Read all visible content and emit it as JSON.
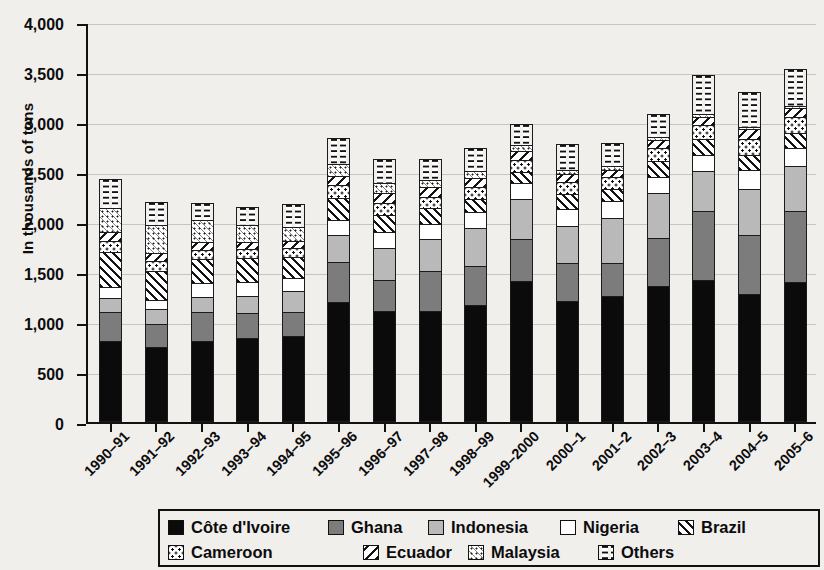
{
  "chart_data": {
    "type": "bar",
    "stacked": true,
    "title": "",
    "subtitle": "",
    "xlabel": "",
    "ylabel": "In thousands of tons",
    "ylim": [
      0,
      4000
    ],
    "ytick_labels": [
      "0",
      "500",
      "1,000",
      "1,500",
      "2,000",
      "2,500",
      "3,000",
      "3,500",
      "4,000"
    ],
    "ytick_values": [
      0,
      500,
      1000,
      1500,
      2000,
      2500,
      3000,
      3500,
      4000
    ],
    "grid": true,
    "legend_position": "bottom",
    "categories": [
      "1990–91",
      "1991–92",
      "1992–93",
      "1993–94",
      "1994–95",
      "1995–96",
      "1996–97",
      "1997–98",
      "1998–99",
      "1999–2000",
      "2000–1",
      "2001–2",
      "2002–3",
      "2003–4",
      "2004–5",
      "2005–6"
    ],
    "series": [
      {
        "name": "Côte d'Ivoire",
        "key": "cote",
        "values": [
          815,
          750,
          815,
          845,
          865,
          1205,
          1110,
          1110,
          1175,
          1410,
          1215,
          1265,
          1360,
          1420,
          1285,
          1405
        ]
      },
      {
        "name": "Ghana",
        "key": "ghana",
        "values": [
          295,
          245,
          295,
          255,
          245,
          405,
          325,
          410,
          395,
          435,
          385,
          340,
          495,
          700,
          595,
          715
        ]
      },
      {
        "name": "Indonesia",
        "key": "indonesia",
        "values": [
          150,
          155,
          165,
          180,
          225,
          285,
          325,
          330,
          390,
          410,
          385,
          455,
          455,
          410,
          475,
          460
        ]
      },
      {
        "name": "Nigeria",
        "key": "nigeria",
        "values": [
          120,
          100,
          145,
          150,
          140,
          160,
          170,
          160,
          170,
          165,
          175,
          185,
          175,
          175,
          200,
          190
        ]
      },
      {
        "name": "Brazil",
        "key": "brazil",
        "values": [
          365,
          300,
          255,
          250,
          215,
          230,
          185,
          170,
          140,
          125,
          160,
          125,
          165,
          165,
          160,
          160
        ]
      },
      {
        "name": "Cameroon",
        "key": "cameroon",
        "values": [
          115,
          115,
          100,
          100,
          105,
          135,
          125,
          125,
          135,
          130,
          135,
          130,
          140,
          155,
          165,
          170
        ]
      },
      {
        "name": "Ecuador",
        "key": "ecuador",
        "values": [
          100,
          90,
          90,
          80,
          75,
          105,
          110,
          105,
          100,
          95,
          90,
          85,
          90,
          90,
          110,
          105
        ]
      },
      {
        "name": "Malaysia",
        "key": "malaysia",
        "values": [
          255,
          290,
          225,
          180,
          155,
          130,
          115,
          85,
          75,
          70,
          50,
          50,
          45,
          40,
          35,
          30
        ]
      },
      {
        "name": "Others",
        "key": "others",
        "values": [
          300,
          240,
          185,
          195,
          240,
          265,
          250,
          215,
          240,
          225,
          265,
          235,
          235,
          395,
          360,
          375
        ]
      }
    ],
    "totals": [
      2515,
      2285,
      2275,
      2235,
      2265,
      2920,
      2715,
      2710,
      2820,
      3065,
      2860,
      2870,
      3160,
      3550,
      3385,
      3610
    ]
  },
  "legend": {
    "row1": [
      {
        "label": "Côte d'Ivoire",
        "key": "cote"
      },
      {
        "label": "Ghana",
        "key": "ghana"
      },
      {
        "label": "Indonesia",
        "key": "indonesia"
      },
      {
        "label": "Nigeria",
        "key": "nigeria"
      },
      {
        "label": "Brazil",
        "key": "brazil"
      }
    ],
    "row2": [
      {
        "label": "Cameroon",
        "key": "cameroon"
      },
      {
        "label": "Ecuador",
        "key": "ecuador"
      },
      {
        "label": "Malaysia",
        "key": "malaysia"
      },
      {
        "label": "Others",
        "key": "others"
      }
    ]
  },
  "colors": {
    "cote": "#0b0b0b",
    "ghana": "#7c7c7c",
    "indonesia": "#b9b9b9",
    "nigeria": "#ffffff",
    "axis": "#111111",
    "grid": "#c8c5c0",
    "background": "#f1efec"
  }
}
